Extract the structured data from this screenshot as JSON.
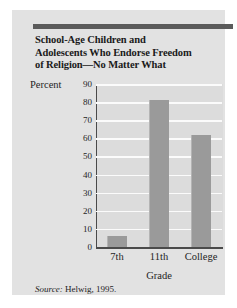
{
  "figure": {
    "title_lines": [
      "School-Age Children and",
      "Adolescents Who Endorse Freedom",
      "of Religion—No Matter What"
    ],
    "source_label": "Source:",
    "source_text": "Helwig, 1995.",
    "colors": {
      "card_background": "#e2e2e2",
      "plot_background": "#dcdcdc",
      "bar_fill": "#9a9a9a",
      "gridline": "#fbfbfb",
      "axis": "#4a4a4a",
      "rule": "#5b5b5b",
      "text": "#1a1a1a"
    }
  },
  "chart_data": {
    "type": "bar",
    "title": "School-Age Children and Adolescents Who Endorse Freedom of Religion—No Matter What",
    "categories": [
      "7th",
      "11th",
      "College"
    ],
    "values": [
      6,
      81,
      62
    ],
    "xlabel": "Grade",
    "ylabel": "Percent",
    "ylim": [
      0,
      90
    ],
    "yticks": [
      0,
      10,
      20,
      30,
      40,
      50,
      60,
      70,
      80,
      90
    ],
    "ytick_labels": [
      "0",
      "10",
      "20",
      "30",
      "40",
      "50",
      "60",
      "70",
      "80",
      "90"
    ],
    "grid": true,
    "legend": false,
    "source": "Source: Helwig, 1995."
  }
}
